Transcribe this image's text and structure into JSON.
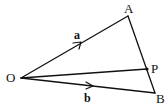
{
  "diagram": {
    "type": "vector-triangle",
    "points": {
      "O": {
        "label": "O",
        "x": 21,
        "y": 78
      },
      "A": {
        "label": "A",
        "x": 128,
        "y": 16
      },
      "B": {
        "label": "B",
        "x": 155,
        "y": 93
      },
      "P": {
        "label": "P",
        "x": 147,
        "y": 69
      }
    },
    "segments": [
      {
        "from": "O",
        "to": "A",
        "vector_label": "a",
        "arrow": true
      },
      {
        "from": "O",
        "to": "B",
        "vector_label": "b",
        "arrow": true
      },
      {
        "from": "O",
        "to": "P",
        "arrow": false
      },
      {
        "from": "A",
        "to": "B",
        "arrow": false
      }
    ],
    "labels": {
      "O": "O",
      "A": "A",
      "B": "B",
      "P": "P",
      "vec_a": "a",
      "vec_b": "b"
    },
    "colors": {
      "stroke": "#111111",
      "background": "#ffffff"
    }
  }
}
